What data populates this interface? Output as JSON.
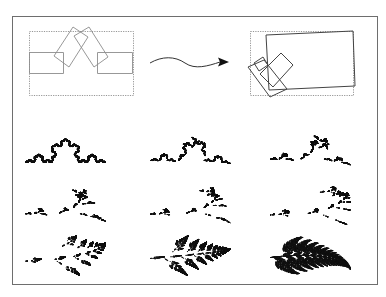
{
  "figure": {
    "width": 386,
    "height": 297,
    "background": "#ffffff",
    "frame": {
      "x": 12.5,
      "y": 16.5,
      "w": 365,
      "h": 268,
      "color": "#6e6e6e"
    },
    "top_row": {
      "left_panel": {
        "label": "initial IFS maps (Koch-like)",
        "bounding_box": {
          "x": 29.5,
          "y": 31.5,
          "w": 104,
          "h": 64
        },
        "rectangles": [
          {
            "points": "29.5,52.5 63.5,52.5 63.5,73.5 29.5,73.5"
          },
          {
            "points": "97.5,52.5 132.5,52.5 132.5,73.5 97.5,73.5"
          },
          {
            "points": "54,56 73,27 88,37 69,67"
          },
          {
            "points": "74,36 89,27 108,57 94,67"
          }
        ],
        "stroke": "#8c8c8c"
      },
      "arrow": {
        "label": "morph arrow",
        "path": "M150,63 C162,56 175,56 185,63 C195,70 208,66 220,62",
        "head": "229,62 218,57.5 220,62 218,66.5",
        "color": "#111111"
      },
      "right_panel": {
        "label": "final IFS maps (fern-like)",
        "bounding_box": {
          "x": 250.5,
          "y": 31.5,
          "w": 103,
          "h": 64
        },
        "rectangles": [
          {
            "points": "266,35 353,31 355,86 269,90"
          },
          {
            "points": "260,74 281,53 293,65 273,87"
          },
          {
            "points": "248,67 264,60 287,89 270,97"
          },
          {
            "points": "254,63 263,57 268,65 259,71"
          }
        ],
        "stroke": "#444444"
      }
    },
    "grid": {
      "color": "#111111",
      "rows": 3,
      "cols": 3,
      "cells": [
        {
          "name": "koch-stage-1",
          "t": 0.0,
          "cx": 65,
          "cy": 150,
          "scale": 80
        },
        {
          "name": "koch-stage-2",
          "t": 0.12,
          "cx": 190,
          "cy": 150,
          "scale": 80
        },
        {
          "name": "koch-stage-3",
          "t": 0.25,
          "cx": 310,
          "cy": 150,
          "scale": 80
        },
        {
          "name": "dendrite-1",
          "t": 0.38,
          "cx": 65,
          "cy": 205,
          "scale": 80
        },
        {
          "name": "dendrite-2",
          "t": 0.46,
          "cx": 190,
          "cy": 205,
          "scale": 80
        },
        {
          "name": "dendrite-3",
          "t": 0.54,
          "cx": 310,
          "cy": 205,
          "scale": 80
        },
        {
          "name": "fern-stage-1",
          "t": 0.7,
          "cx": 65,
          "cy": 255,
          "scale": 80
        },
        {
          "name": "fern-stage-2",
          "t": 0.85,
          "cx": 190,
          "cy": 255,
          "scale": 80
        },
        {
          "name": "fern-stage-3",
          "t": 1.0,
          "cx": 310,
          "cy": 255,
          "scale": 80
        }
      ]
    }
  }
}
